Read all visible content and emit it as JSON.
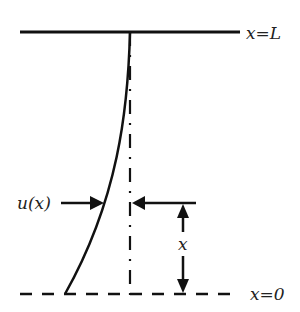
{
  "diagram": {
    "labels": {
      "top": "x=L",
      "bottom": "x=0",
      "deflection": "u(x)",
      "height": "x"
    },
    "colors": {
      "stroke": "#111111",
      "background": "#ffffff"
    }
  }
}
